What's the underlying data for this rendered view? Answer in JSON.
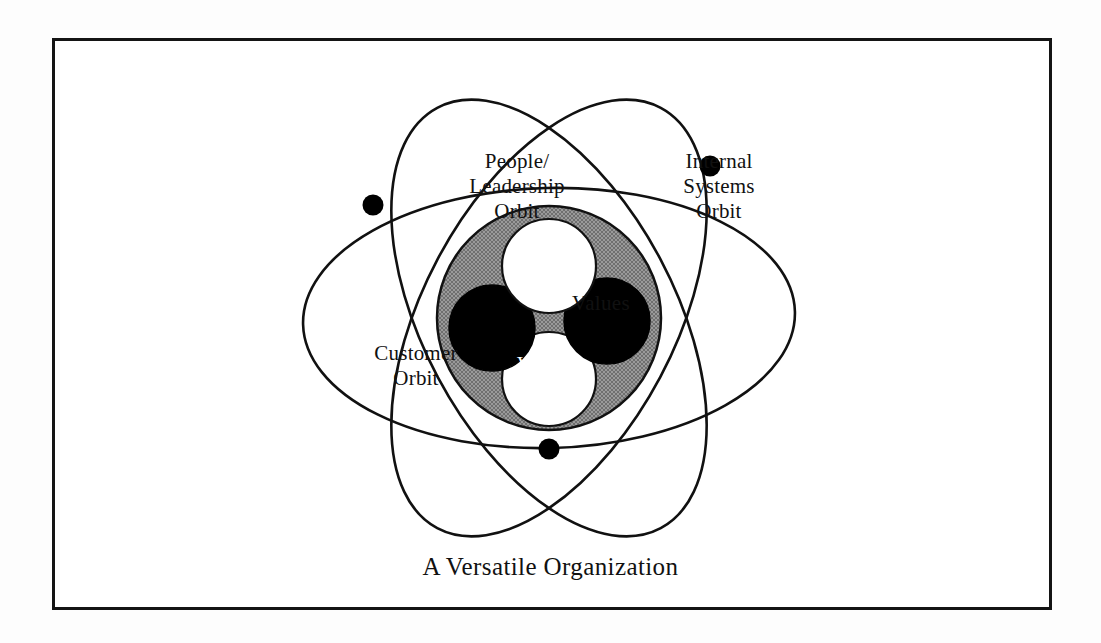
{
  "caption": "A Versatile Organization",
  "colors": {
    "frame_border": "#141414",
    "background": "#ffffff",
    "nucleus_ring": "#8a8a8a",
    "nucleus_dark_circle": "#000000",
    "nucleus_light_circle": "#ffffff",
    "orbit_line": "#111111",
    "electron_dot": "#000000"
  },
  "orbits": [
    {
      "id": "people-leadership",
      "label": "People/\nLeadership\nOrbit",
      "label_lines": [
        "People/",
        "Leadership",
        "Orbit"
      ],
      "tilt_degrees": -32
    },
    {
      "id": "internal-systems",
      "label": "Internal\nSystems\nOrbit",
      "label_lines": [
        "Internal",
        "Systems",
        "Orbit"
      ],
      "tilt_degrees": 32
    },
    {
      "id": "customer",
      "label": "Customer\nOrbit",
      "label_lines": [
        "Customer",
        "Orbit"
      ],
      "tilt_degrees": 0
    }
  ],
  "electrons": [
    {
      "id": "electron-people-leadership",
      "x": 370,
      "y": 202,
      "r": 10
    },
    {
      "id": "electron-internal-systems",
      "x": 707,
      "y": 163,
      "r": 10
    },
    {
      "id": "electron-customer",
      "x": 546,
      "y": 446,
      "r": 10
    }
  ],
  "nucleus": {
    "ring_center": {
      "x": 546,
      "y": 315
    },
    "ring_outer_radius": 112,
    "ring_inner_radius": 0,
    "circles": [
      {
        "id": "values",
        "label": "Values",
        "fill": "light",
        "x": 546,
        "y": 263,
        "r": 47
      },
      {
        "id": "vision",
        "label": "Vision",
        "fill": "dark",
        "x": 489,
        "y": 325,
        "r": 43
      },
      {
        "id": "unlabeled-right",
        "label": "",
        "fill": "dark",
        "x": 604,
        "y": 318,
        "r": 43
      },
      {
        "id": "unlabeled-bottom",
        "label": "",
        "fill": "light",
        "x": 546,
        "y": 376,
        "r": 47
      }
    ]
  },
  "labels": {
    "values": "Values",
    "vision": "Vision"
  }
}
